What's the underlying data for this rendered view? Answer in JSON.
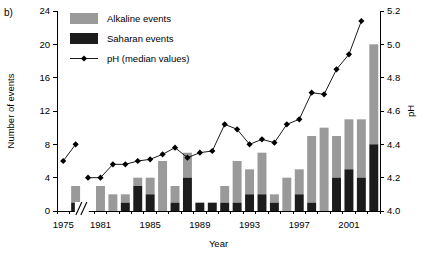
{
  "panel": {
    "label": "b)"
  },
  "legend": {
    "items": [
      {
        "key": "alkaline",
        "label": "Alkaline events",
        "marker": "swatch",
        "color": "#9a9a9a"
      },
      {
        "key": "saharan",
        "label": "Saharan events",
        "marker": "swatch",
        "color": "#1c1c1c"
      },
      {
        "key": "ph",
        "label": "pH (median values)",
        "marker": "line-diamond-icon",
        "color": "#000000"
      }
    ]
  },
  "axes": {
    "left": {
      "title": "Number of events",
      "ticks": [
        0,
        4,
        8,
        12,
        16,
        20,
        24
      ],
      "min": 0,
      "max": 24
    },
    "right": {
      "title": "pH",
      "ticks": [
        "4.0",
        "4.2",
        "4.4",
        "4.6",
        "4.8",
        "5.0",
        "5.2"
      ],
      "min": 4.0,
      "max": 5.2
    },
    "bottom": {
      "title": "Year",
      "ticks": [
        1975,
        1981,
        1985,
        1989,
        1993,
        1997,
        2001
      ],
      "break_between": [
        1976,
        1980
      ],
      "break_symbol": "//"
    }
  },
  "chart_data": {
    "type": "bar",
    "title": "",
    "xlabel": "Year",
    "ylabel": "Number of events",
    "y2label": "pH",
    "ylim": [
      0,
      24
    ],
    "y2lim": [
      4.0,
      5.2
    ],
    "grid": false,
    "legend_position": "top-left-inside",
    "stacked": true,
    "categories": [
      1975,
      1976,
      1980,
      1981,
      1982,
      1983,
      1984,
      1985,
      1986,
      1987,
      1988,
      1989,
      1990,
      1991,
      1992,
      1993,
      1994,
      1995,
      1996,
      1997,
      1998,
      1999,
      2000,
      2001,
      2002,
      2003
    ],
    "series": [
      {
        "name": "Saharan events",
        "color": "#1c1c1c",
        "values": [
          0,
          1,
          0,
          0,
          0,
          1,
          3,
          2,
          0,
          1,
          4,
          1,
          1,
          1,
          1,
          2,
          2,
          1,
          0,
          2,
          1,
          0,
          4,
          5,
          4,
          8
        ]
      },
      {
        "name": "Alkaline events",
        "color": "#9a9a9a",
        "values": [
          0,
          2,
          0,
          3,
          2,
          1,
          1,
          2,
          6,
          2,
          3,
          0,
          0,
          2,
          5,
          3,
          5,
          1,
          4,
          3,
          8,
          10,
          5,
          6,
          7,
          12
        ]
      }
    ],
    "totals": [
      0,
      3,
      0,
      3,
      2,
      2,
      4,
      4,
      6,
      3,
      7,
      1,
      1,
      3,
      6,
      5,
      7,
      2,
      4,
      5,
      9,
      10,
      9,
      11,
      11,
      20
    ],
    "ph_series": {
      "name": "pH (median values)",
      "marker": "diamond",
      "color": "#000000",
      "x": [
        1975,
        1976,
        1980,
        1981,
        1982,
        1983,
        1984,
        1985,
        1986,
        1987,
        1988,
        1989,
        1990,
        1991,
        1992,
        1993,
        1994,
        1995,
        1996,
        1997,
        1998,
        1999,
        2000,
        2001,
        2002
      ],
      "values": [
        4.3,
        4.4,
        4.2,
        4.2,
        4.28,
        4.28,
        4.3,
        4.31,
        4.34,
        4.38,
        4.32,
        4.35,
        4.36,
        4.52,
        4.49,
        4.4,
        4.43,
        4.41,
        4.52,
        4.55,
        4.71,
        4.7,
        4.85,
        4.94,
        5.14
      ]
    }
  }
}
